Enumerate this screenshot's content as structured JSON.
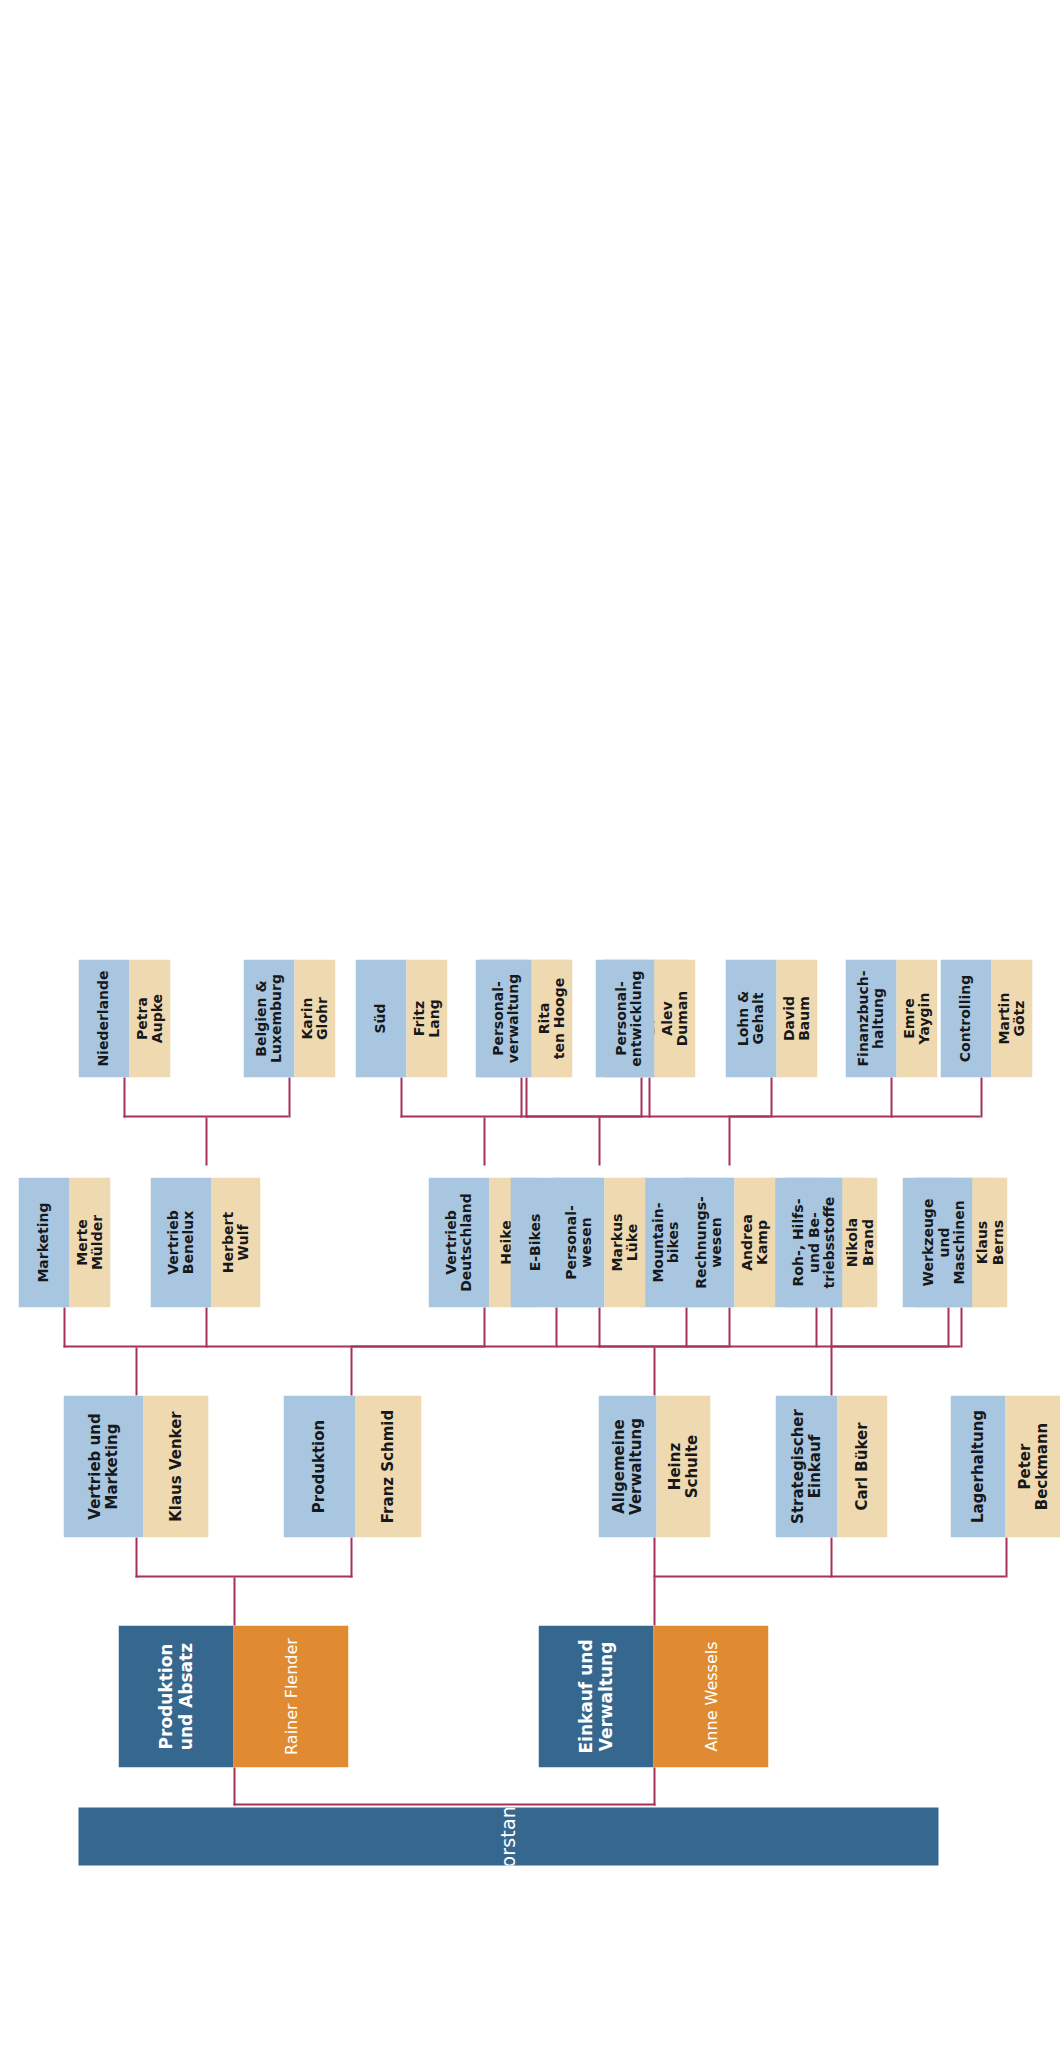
{
  "chart": {
    "orientation": "rotated-90",
    "colors": {
      "root_bg": "#36688f",
      "level1_unit_bg": "#36688f",
      "level1_person_bg": "#e08b32",
      "unit_bg": "#a8c6e0",
      "person_bg": "#efd9b0",
      "connector": "#a6315a",
      "page_bg": "#ffffff"
    }
  },
  "nodes": {
    "root": {
      "unit": "Vorstand",
      "person": ""
    },
    "prod_absatz": {
      "unit": "Produktion und Absatz",
      "person": "Rainer Flender"
    },
    "einkauf_verw": {
      "unit": "Einkauf und Verwaltung",
      "person": "Anne Wessels"
    },
    "vertrieb_mkt": {
      "unit": "Vertrieb und\nMarketing",
      "person": "Klaus Venker"
    },
    "produktion": {
      "unit": "Produktion",
      "person": "Franz Schmid"
    },
    "marketing": {
      "unit": "Marketing",
      "person": "Merte\nMülder"
    },
    "vertrieb_bnl": {
      "unit": "Vertrieb\nBenelux",
      "person": "Herbert\nWulf"
    },
    "vertrieb_de": {
      "unit": "Vertrieb\nDeutschland",
      "person": "Heike\nWemer"
    },
    "niederlande": {
      "unit": "Niederlande",
      "person": "Petra\nAupke"
    },
    "belgien_lux": {
      "unit": "Belgien &\nLuxemburg",
      "person": "Karin\nGlohr"
    },
    "sued": {
      "unit": "Süd",
      "person": "Fritz\nLang"
    },
    "west": {
      "unit": "West",
      "person": "Harald\nPeters"
    },
    "nord_ost": {
      "unit": "Nord/Ost",
      "person": "Rico\nMeier"
    },
    "e_bikes": {
      "unit": "E-Bikes",
      "person": "Alex\nProksch"
    },
    "mountainbikes": {
      "unit": "Mountain-\nbikes",
      "person": "Klaus\nVolland"
    },
    "tourenraeder": {
      "unit": "Touringräder",
      "person": "Kurt\nMann"
    },
    "rennraeder": {
      "unit": "Rennräder",
      "person": "Michel\nPinkall"
    },
    "lagerhaltung": {
      "unit": "Lagerhaltung",
      "person": "Peter Beckmann"
    },
    "strat_einkauf": {
      "unit": "Strategischer\nEinkauf",
      "person": "Carl Büker"
    },
    "allg_verwaltung": {
      "unit": "Allgemeine\nVerwaltung",
      "person": "Heinz\nSchulte"
    },
    "personalwesen": {
      "unit": "Personal-\nwesen",
      "person": "Markus\nLüke"
    },
    "rechnungswesen": {
      "unit": "Rechnungs-\nwesen",
      "person": "Andrea\nKamp"
    },
    "roh_hilfs": {
      "unit": "Roh-, Hilfs-\nund Be-\ntriebsstoffe",
      "person": "Nikola\nBrand"
    },
    "werkzeuge": {
      "unit": "Werkzeuge\nund\nMaschinen",
      "person": "Klaus\nBerns"
    },
    "personalverw": {
      "unit": "Personal-\nverwaltung",
      "person": "Rita\nten Hooge"
    },
    "personalentw": {
      "unit": "Personal-\nentwicklung",
      "person": "Alev\nDuman"
    },
    "lohn_gehalt": {
      "unit": "Lohn &\nGehalt",
      "person": "David\nBaum"
    },
    "finanzbuch": {
      "unit": "Finanzbuch-\nhaltung",
      "person": "Emre\nYaygin"
    },
    "controlling": {
      "unit": "Controlling",
      "person": "Martin\nGötz"
    }
  }
}
